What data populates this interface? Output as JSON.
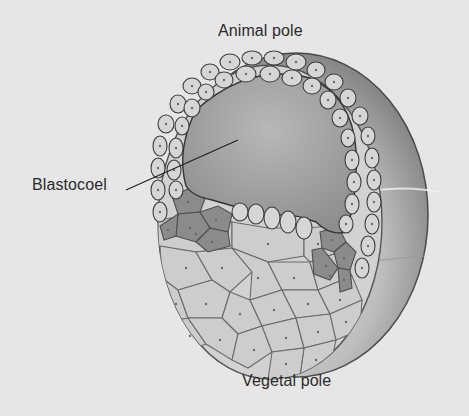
{
  "figure": {
    "labels": {
      "animal_pole": "Animal pole",
      "blastocoel": "Blastocoel",
      "vegetal_pole": "Vegetal pole"
    },
    "colors": {
      "background": "#e6e6e6",
      "sphere_dark": "#6e6e6e",
      "sphere_light": "#d0d0d0",
      "blastocoel_fill": "#a9a9a9",
      "light_cell": "#cfcfcf",
      "medium_cell": "#bdbdbd",
      "dark_cell": "#8d8d8d",
      "cell_border": "#555555",
      "leader_line": "#222222"
    }
  }
}
